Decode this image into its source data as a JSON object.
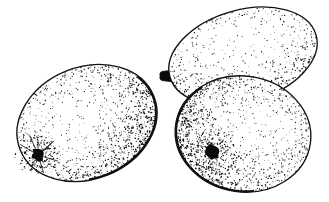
{
  "image": {
    "title": "Line drawing of three oval fruits",
    "style": "pen-and-ink stipple engraving",
    "background_color": "#ffffff",
    "ink_color": "#0a0a0a",
    "width": 329,
    "height": 202
  },
  "objects": [
    {
      "id": "fruit-left",
      "label": "left oval fruit",
      "shape": "ellipse",
      "center_x": 87,
      "center_y": 123,
      "radius_x": 72,
      "radius_y": 56,
      "rotation_deg": -22,
      "shading": "stippled lower-right",
      "has_stem": false,
      "blossom_spot": {
        "label": "dark blossom end scar",
        "x": 38,
        "y": 155,
        "radius": 7,
        "color": "#0a0a0a",
        "has_rays": true
      }
    },
    {
      "id": "fruit-upper-right",
      "label": "upper right oval fruit",
      "shape": "ellipse",
      "center_x": 243,
      "center_y": 56,
      "radius_x": 76,
      "radius_y": 46,
      "rotation_deg": -16,
      "shading": "stippled lower edge",
      "has_stem": true,
      "stem": {
        "label": "short woody stem",
        "x": 160,
        "y": 76,
        "width": 14,
        "height": 12,
        "color": "#0a0a0a"
      },
      "blossom_spot": null
    },
    {
      "id": "fruit-lower-right",
      "label": "lower right oval fruit",
      "shape": "ellipse",
      "center_x": 243,
      "center_y": 134,
      "radius_x": 68,
      "radius_y": 58,
      "rotation_deg": 8,
      "shading": "stippled lower-left and bottom",
      "has_stem": false,
      "blossom_spot": {
        "label": "dark blossom end scar",
        "x": 213,
        "y": 152,
        "radius": 8,
        "color": "#0a0a0a",
        "has_rays": false
      }
    }
  ],
  "stipple": {
    "seed": 20240917,
    "dot_color": "#141414",
    "min_radius": 0.32,
    "max_radius": 0.85,
    "regions": [
      {
        "owner": "fruit-left",
        "count": 2600,
        "edge_bias": 2.6,
        "axis_deg": 40
      },
      {
        "owner": "fruit-upper-right",
        "count": 1500,
        "edge_bias": 3.2,
        "axis_deg": 95
      },
      {
        "owner": "fruit-lower-right",
        "count": 2800,
        "edge_bias": 2.4,
        "axis_deg": 150
      }
    ]
  }
}
